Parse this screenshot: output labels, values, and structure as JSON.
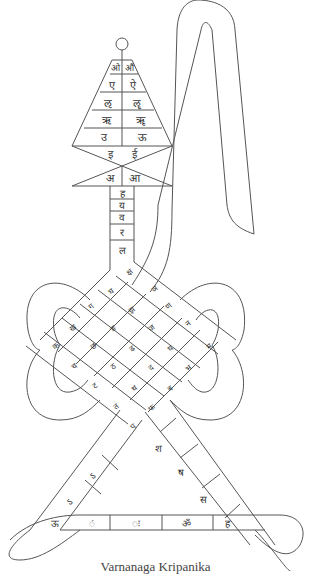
{
  "caption": "Varnanaga Kripanika",
  "colors": {
    "stroke": "#555555",
    "text": "#333333",
    "background": "#ffffff"
  },
  "head": {
    "top_circle": true,
    "rows": [
      [
        "ओ",
        "औ"
      ],
      [
        "ए",
        "ऐ"
      ],
      [
        "ऌ",
        "ॡ"
      ],
      [
        "ऋ",
        "ॠ"
      ],
      [
        "उ",
        "ऊ"
      ],
      [
        "इ",
        "ई"
      ]
    ],
    "base": [
      "अ",
      "आ"
    ]
  },
  "neck": [
    "ह",
    "य",
    "व",
    "र",
    "ल"
  ],
  "knot": {
    "cells": [
      {
        "id": "c1",
        "label": "क्ष"
      },
      {
        "id": "c2",
        "label": "ञ"
      },
      {
        "id": "c3",
        "label": "घ"
      },
      {
        "id": "c4",
        "label": "ग"
      },
      {
        "id": "c5",
        "label": "झ"
      },
      {
        "id": "c6",
        "label": "ण"
      },
      {
        "id": "c7",
        "label": "ख"
      },
      {
        "id": "c8",
        "label": "ङ"
      },
      {
        "id": "c9",
        "label": "ज"
      },
      {
        "id": "c10",
        "label": "न"
      },
      {
        "id": "c11",
        "label": "क"
      },
      {
        "id": "c12",
        "label": "छ"
      },
      {
        "id": "c13",
        "label": "ढ"
      },
      {
        "id": "c14",
        "label": "ध"
      },
      {
        "id": "c15",
        "label": "म"
      },
      {
        "id": "c16",
        "label": "च"
      },
      {
        "id": "c17",
        "label": "ठ"
      },
      {
        "id": "c18",
        "label": "द"
      },
      {
        "id": "c19",
        "label": "भ"
      },
      {
        "id": "c20",
        "label": "ट"
      },
      {
        "id": "c21",
        "label": "थ"
      },
      {
        "id": "c22",
        "label": "ब"
      },
      {
        "id": "c23",
        "label": "त"
      },
      {
        "id": "c24",
        "label": "फ"
      },
      {
        "id": "c25",
        "label": "प"
      }
    ]
  },
  "tail_right": [
    "श",
    "ष",
    "स"
  ],
  "tail_left": [
    "ऽ",
    "ऽ"
  ],
  "base_bar": [
    "ऊ",
    "ं",
    "ः",
    "ॐ",
    "ह"
  ]
}
